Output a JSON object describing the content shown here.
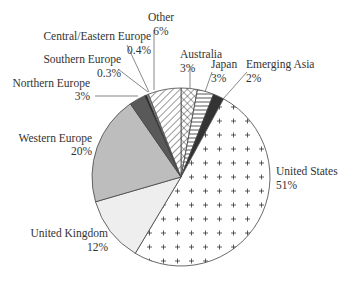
{
  "chart_data": {
    "type": "pie",
    "title": "",
    "start_angle_deg": 0,
    "direction": "clockwise",
    "slices": [
      {
        "label": "Australia",
        "value": 3,
        "display": "3%",
        "pattern": "crosshatch"
      },
      {
        "label": "Japan",
        "value": 3,
        "display": "3%",
        "pattern": "horizontal-lines"
      },
      {
        "label": "Emerging Asia",
        "value": 2,
        "display": "2%",
        "pattern": "solid-dark"
      },
      {
        "label": "United States",
        "value": 51,
        "display": "51%",
        "pattern": "plus-dots"
      },
      {
        "label": "United Kingdom",
        "value": 12,
        "display": "12%",
        "pattern": "light-gray"
      },
      {
        "label": "Western Europe",
        "value": 20,
        "display": "20%",
        "pattern": "mid-gray"
      },
      {
        "label": "Northern Europe",
        "value": 3,
        "display": "3%",
        "pattern": "dark-gray"
      },
      {
        "label": "Southern Europe",
        "value": 0.3,
        "display": "0.3%",
        "pattern": "black"
      },
      {
        "label": "Central/Eastern Europe",
        "value": 0.4,
        "display": "0.4%",
        "pattern": "gray"
      },
      {
        "label": "Other",
        "value": 6,
        "display": "6%",
        "pattern": "diagonal-lines"
      }
    ],
    "legend": "none (labels with leader lines)"
  },
  "labels": {
    "australia": {
      "name": "Australia",
      "pct": "3%"
    },
    "japan": {
      "name": "Japan",
      "pct": "3%"
    },
    "emerging_asia": {
      "name": "Emerging Asia",
      "pct": "2%"
    },
    "united_states": {
      "name": "United States",
      "pct": "51%"
    },
    "united_kingdom": {
      "name": "United Kingdom",
      "pct": "12%"
    },
    "western_europe": {
      "name": "Western Europe",
      "pct": "20%"
    },
    "northern_europe": {
      "name": "Northern Europe",
      "pct": "3%"
    },
    "southern_europe": {
      "name": "Southern Europe",
      "pct": "0.3%"
    },
    "central_eastern_europe": {
      "name": "Central/Eastern Europe",
      "pct": "0.4%"
    },
    "other": {
      "name": "Other",
      "pct": "6%"
    }
  }
}
